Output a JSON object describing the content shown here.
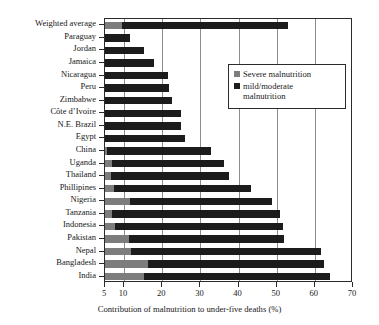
{
  "chart_data": {
    "type": "bar",
    "orientation": "horizontal",
    "stacked": true,
    "title": "",
    "xlabel": "Contribution of malnutrition to under-five deaths (%)",
    "ylabel": "",
    "xlim": [
      5,
      70
    ],
    "xticks": [
      5,
      10,
      20,
      30,
      40,
      50,
      60,
      70
    ],
    "xtick_labels": [
      "5",
      "10",
      "20",
      "30",
      "40",
      "50",
      "60",
      "70"
    ],
    "grid": true,
    "grid_axis": "x",
    "legend_position": "upper right",
    "categories": [
      "Weighted average",
      "Paraguay",
      "Jordan",
      "Jamaica",
      "Nicaragua",
      "Peru",
      "Zimbabwe",
      "Côte d’Ivoire",
      "N.E. Brazil",
      "Egypt",
      "China",
      "Uganda",
      "Thailand",
      "Phillipines",
      "Nigeria",
      "Tanzania",
      "Indonesia",
      "Pakistan",
      "Nepal",
      "Bangladesh",
      "India"
    ],
    "series": [
      {
        "name": "Severe malnutrition",
        "color": "#7d7d7d",
        "values": [
          9.4,
          5.0,
          5.0,
          5.0,
          5.0,
          5.0,
          5.0,
          5.0,
          5.0,
          5.0,
          5.4,
          6.9,
          6.5,
          7.3,
          11.6,
          6.9,
          7.5,
          11.4,
          11.9,
          16.3,
          15.3
        ]
      },
      {
        "name": "mild/moderate malnutrition",
        "color": "#1c1c1c",
        "values": [
          43.6,
          6.5,
          10.3,
          12.8,
          16.6,
          16.8,
          17.6,
          20.0,
          20.0,
          20.9,
          27.3,
          29.4,
          31.1,
          35.9,
          37.1,
          43.9,
          44.2,
          40.5,
          49.8,
          46.1,
          48.6
        ]
      }
    ],
    "totals": [
      53.0,
      11.5,
      15.3,
      17.8,
      21.6,
      21.8,
      22.6,
      25.0,
      25.0,
      25.9,
      32.7,
      36.3,
      37.6,
      43.2,
      48.7,
      50.8,
      51.7,
      51.9,
      61.7,
      62.4,
      63.9
    ],
    "legend": [
      {
        "label": "Severe malnutrition",
        "color": "#7d7d7d",
        "swatch": "square-gray"
      },
      {
        "label": "mild/moderate\nmalnutrition",
        "color": "#1c1c1c",
        "swatch": "square-black"
      }
    ]
  },
  "colors": {
    "severe": "#7d7d7d",
    "mild": "#1c1c1c",
    "axis": "#2b2b2b",
    "grid": "#8c8c8c",
    "background": "#ffffff"
  }
}
